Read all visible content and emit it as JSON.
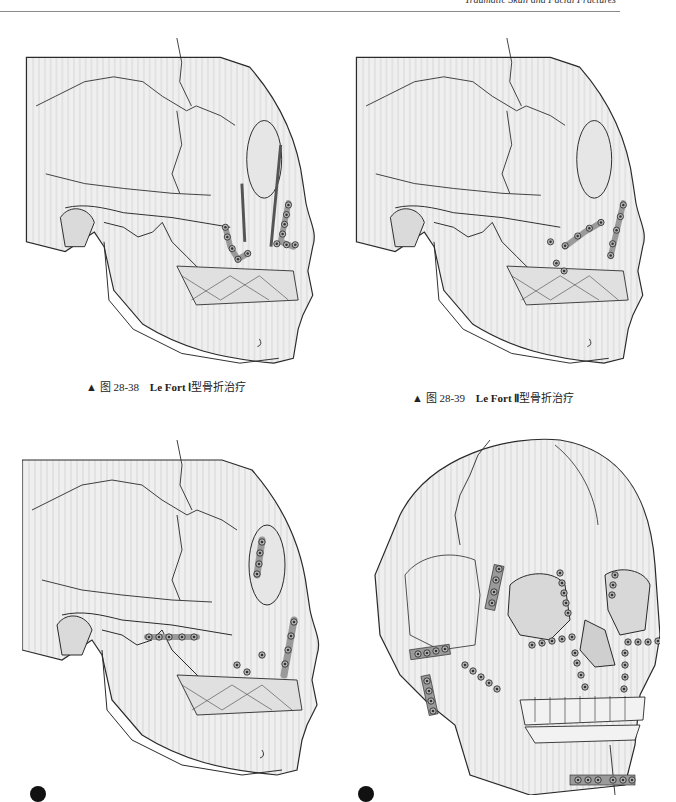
{
  "page": {
    "running_header": "Traumatic Skull and Facial Fractures"
  },
  "figures": [
    {
      "id": "28-38",
      "caption": {
        "marker": "▲",
        "prefix": "图 28-38",
        "en": "Le Fort Ⅰ",
        "zh": "型骨折治疗"
      },
      "view": "lateral"
    },
    {
      "id": "28-39",
      "caption": {
        "marker": "▲",
        "prefix": "图 28-39",
        "en": "Le Fort Ⅱ",
        "zh": "型骨折治疗"
      },
      "view": "lateral"
    },
    {
      "id": "28-40a",
      "caption": null,
      "panel_badge": "A",
      "view": "lateral"
    },
    {
      "id": "28-40b",
      "caption": null,
      "panel_badge": "B",
      "view": "frontal"
    }
  ],
  "colors": {
    "bone": "#ececec",
    "line": "#2a2a2a",
    "plate": "#9a9a9a",
    "shadow": "#c8c8c8"
  }
}
